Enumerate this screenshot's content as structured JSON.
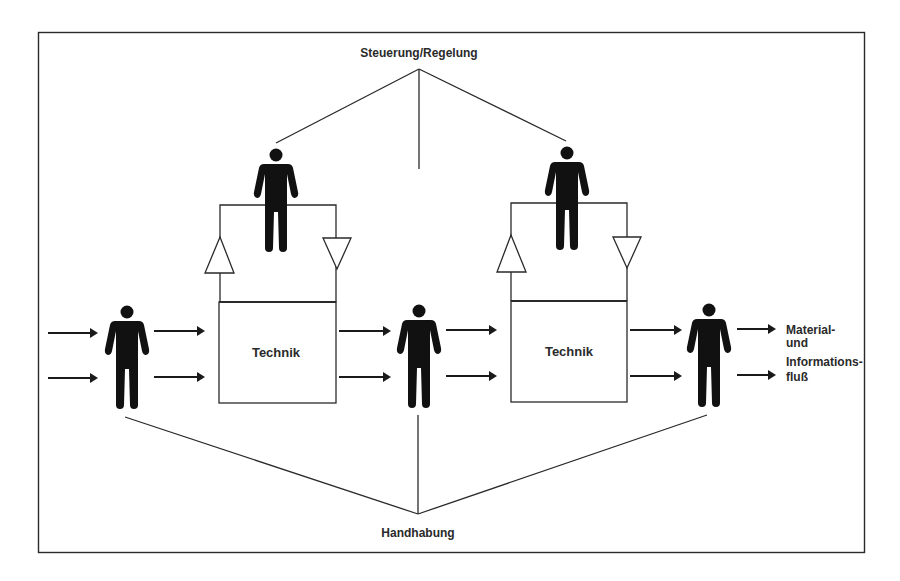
{
  "diagram": {
    "top_label": "Steuerung/Regelung",
    "bottom_label": "Handhabung",
    "boxes": [
      {
        "label": "Technik"
      },
      {
        "label": "Technik"
      }
    ],
    "flow_label": {
      "line1": "Material-",
      "line2": "und",
      "line3": "Informations-",
      "line4": "fluß"
    },
    "colors": {
      "ink": "#2a2a2a",
      "figure": "#111111",
      "background": "#ffffff"
    }
  }
}
